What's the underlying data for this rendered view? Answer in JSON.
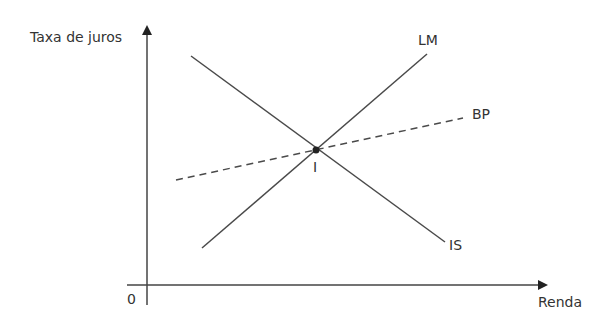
{
  "diagram": {
    "type": "IS-LM-BP model",
    "axes": {
      "y_label": "Taxa de juros",
      "x_label": "Renda",
      "origin_label": "0"
    },
    "curves": [
      {
        "name": "LM",
        "label": "LM",
        "style": "solid",
        "from": [
          202,
          248
        ],
        "to": [
          427,
          54
        ]
      },
      {
        "name": "IS",
        "label": "IS",
        "style": "solid",
        "from": [
          191,
          56
        ],
        "to": [
          445,
          242
        ]
      },
      {
        "name": "BP",
        "label": "BP",
        "style": "dashed",
        "from": [
          176,
          180
        ],
        "to": [
          463,
          118
        ]
      }
    ],
    "equilibrium": {
      "label": "I",
      "point": [
        316,
        150
      ]
    },
    "colors": {
      "line": "#4a4a4a",
      "text": "#333333"
    }
  }
}
